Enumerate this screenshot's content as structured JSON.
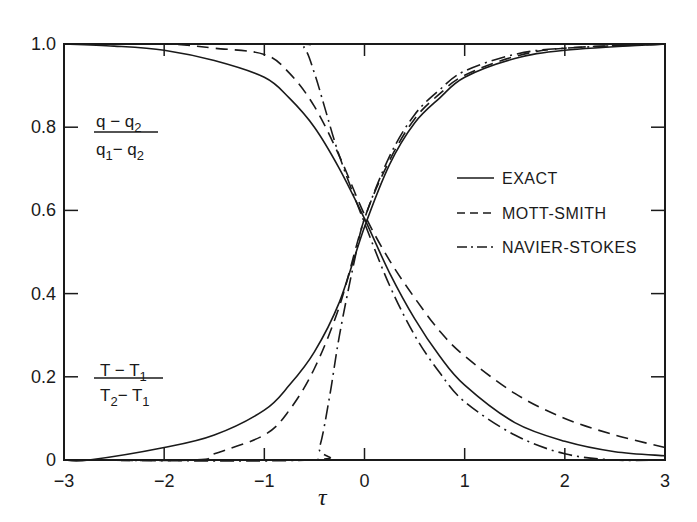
{
  "chart_data": {
    "type": "line",
    "title": "",
    "xlabel": "τ",
    "ylabel": "",
    "xlim": [
      -3,
      3
    ],
    "ylim": [
      0,
      1.0
    ],
    "grid": false,
    "legend_position": "inside right, mid-height",
    "x_ticks": [
      -3,
      -2,
      -1,
      0,
      1,
      2,
      3
    ],
    "x_tick_labels": [
      "−3",
      "−2",
      "−1",
      "0",
      "1",
      "2",
      "3"
    ],
    "y_ticks": [
      0,
      0.2,
      0.4,
      0.6,
      0.8,
      1.0
    ],
    "y_tick_labels": [
      "0",
      "0.2",
      "0.4",
      "0.6",
      "0.8",
      "1.0"
    ],
    "annotations": [
      {
        "id": "density",
        "numerator": "q − q₂",
        "denominator": "q₁ − q₂",
        "numerator_main": "q − q",
        "numerator_sub": "2",
        "denominator_main_a": "q",
        "denominator_sub_a": "1",
        "denominator_main_b": "− q",
        "denominator_sub_b": "2",
        "x": -2.7,
        "y": 0.78
      },
      {
        "id": "temperature",
        "numerator": "T − T₁",
        "denominator": "T₂ − T₁",
        "numerator_main": "T − T",
        "numerator_sub": "1",
        "denominator_main_a": "T",
        "denominator_sub_a": "2",
        "denominator_main_b": "− T",
        "denominator_sub_b": "1",
        "x": -2.7,
        "y": 0.19
      }
    ],
    "legend": [
      {
        "label": "EXACT",
        "style": "solid"
      },
      {
        "label": "MOTT-SMITH",
        "style": "dashed"
      },
      {
        "label": "NAVIER-STOKES",
        "style": "dashdot"
      }
    ],
    "series": [
      {
        "name": "EXACT",
        "quantity": "(q - q2)/(q1 - q2)",
        "style": "solid",
        "x": [
          -3,
          -2.5,
          -2,
          -1.5,
          -1,
          -0.75,
          -0.5,
          -0.25,
          0,
          0.25,
          0.5,
          0.75,
          1,
          1.5,
          2,
          2.5,
          3
        ],
        "y": [
          1.0,
          0.995,
          0.985,
          0.96,
          0.92,
          0.87,
          0.8,
          0.7,
          0.58,
          0.45,
          0.34,
          0.25,
          0.18,
          0.09,
          0.045,
          0.02,
          0.01
        ]
      },
      {
        "name": "MOTT-SMITH",
        "quantity": "(q - q2)/(q1 - q2)",
        "style": "dashed",
        "x": [
          -3,
          -2,
          -1.5,
          -1,
          -0.75,
          -0.5,
          -0.25,
          0,
          0.25,
          0.5,
          0.75,
          1,
          1.5,
          2,
          2.5,
          3
        ],
        "y": [
          1.0,
          1.0,
          0.99,
          0.975,
          0.93,
          0.85,
          0.73,
          0.59,
          0.48,
          0.39,
          0.31,
          0.25,
          0.16,
          0.1,
          0.06,
          0.03
        ]
      },
      {
        "name": "NAVIER-STOKES",
        "quantity": "(q - q2)/(q1 - q2)",
        "style": "dashdot",
        "x": [
          -3,
          -0.75,
          -0.6,
          -0.5,
          -0.4,
          -0.25,
          0,
          0.25,
          0.5,
          0.75,
          1,
          1.5,
          2,
          2.5,
          3
        ],
        "y": [
          1.0,
          1.0,
          0.99,
          0.93,
          0.85,
          0.73,
          0.57,
          0.42,
          0.3,
          0.21,
          0.14,
          0.06,
          0.015,
          0.0,
          0.0
        ]
      },
      {
        "name": "EXACT",
        "quantity": "(T - T1)/(T2 - T1)",
        "style": "solid",
        "x": [
          -3,
          -2.75,
          -2,
          -1.5,
          -1,
          -0.75,
          -0.5,
          -0.25,
          0,
          0.25,
          0.5,
          0.75,
          1,
          1.5,
          2,
          3
        ],
        "y": [
          0.0,
          0.0,
          0.03,
          0.06,
          0.12,
          0.18,
          0.26,
          0.38,
          0.56,
          0.71,
          0.81,
          0.87,
          0.92,
          0.965,
          0.985,
          1.0
        ]
      },
      {
        "name": "MOTT-SMITH",
        "quantity": "(T - T1)/(T2 - T1)",
        "style": "dashed",
        "x": [
          -3,
          -1.7,
          -1.5,
          -1,
          -0.75,
          -0.5,
          -0.25,
          0,
          0.25,
          0.5,
          0.75,
          1,
          1.5,
          2,
          3
        ],
        "y": [
          0.0,
          0.0,
          0.015,
          0.06,
          0.12,
          0.22,
          0.37,
          0.58,
          0.72,
          0.82,
          0.88,
          0.925,
          0.97,
          0.99,
          1.0
        ]
      },
      {
        "name": "NAVIER-STOKES",
        "quantity": "(T - T1)/(T2 - T1)",
        "style": "dashdot",
        "x": [
          -3,
          -0.55,
          -0.45,
          -0.35,
          -0.25,
          -0.1,
          0,
          0.25,
          0.5,
          0.75,
          1,
          1.5,
          2,
          3
        ],
        "y": [
          0.0,
          0.0,
          0.03,
          0.15,
          0.3,
          0.48,
          0.58,
          0.73,
          0.83,
          0.89,
          0.935,
          0.975,
          0.99,
          1.0
        ]
      }
    ],
    "colors": {
      "line": "#1a1a1a",
      "background": "#ffffff"
    }
  }
}
